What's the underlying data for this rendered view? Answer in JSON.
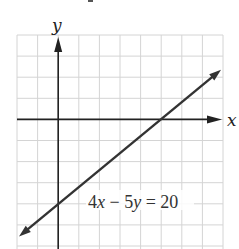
{
  "chart_data": {
    "type": "line",
    "title": "",
    "equation_label": "4x − 5y = 20",
    "xlabel": "x",
    "ylabel": "y",
    "xlim": [
      -2,
      8
    ],
    "ylim": [
      -6,
      4
    ],
    "grid": true,
    "grid_step": 1,
    "tick_labels": false,
    "series": [
      {
        "name": "4x - 5y = 20",
        "slope": 0.8,
        "intercept": -4,
        "x_intercept": 5,
        "y_intercept": -4,
        "x": [
          -2,
          0,
          5,
          8
        ],
        "y": [
          -5.6,
          -4,
          0,
          2.4
        ],
        "arrows_both_ends": true
      }
    ]
  },
  "labels": {
    "x_axis": "x",
    "y_axis": "y",
    "equation": "4x − 5y = 20"
  },
  "colors": {
    "grid": "#d4d4d4",
    "axes": "#222222",
    "line": "#333333",
    "text": "#333333"
  }
}
